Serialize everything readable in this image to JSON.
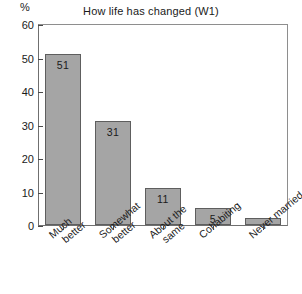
{
  "chart_data": {
    "type": "bar",
    "title": "How life has changed (W1)",
    "xlabel": "",
    "ylabel": "%",
    "ylim": [
      0,
      60
    ],
    "yticks": [
      0,
      10,
      20,
      30,
      40,
      50,
      60
    ],
    "grid": false,
    "legend": "none",
    "orientation": "vertical",
    "bar_color": "#a5a5a5",
    "bar_edge_color": "#5e5e5e",
    "categories": [
      "Much better",
      "Somewhat better",
      "About the same",
      "Cohabiting",
      "Never married"
    ],
    "category_lines": [
      [
        "Much",
        "better"
      ],
      [
        "Somewhat",
        "better"
      ],
      [
        "About the",
        "same"
      ],
      [
        "Cohabiting"
      ],
      [
        "Never married"
      ]
    ],
    "values": [
      51,
      31,
      11,
      5,
      2
    ],
    "data_labels": [
      "51",
      "31",
      "11",
      "5",
      ""
    ]
  },
  "axis": {
    "unit_label": "%",
    "tick_labels": [
      "60",
      "50",
      "40",
      "30",
      "20",
      "10",
      "0"
    ]
  }
}
